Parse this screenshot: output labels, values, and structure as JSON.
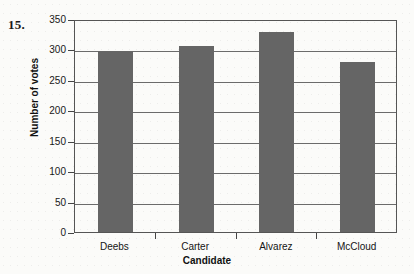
{
  "exercise": {
    "number": "15."
  },
  "chart_data": {
    "type": "bar",
    "title": "",
    "xlabel": "Candidate",
    "ylabel": "Number of votes",
    "categories": [
      "Deebs",
      "Carter",
      "Alvarez",
      "McCloud"
    ],
    "values": [
      297,
      305,
      329,
      280
    ],
    "ylim": [
      0,
      350
    ],
    "yticks": [
      0,
      50,
      100,
      150,
      200,
      250,
      300,
      350
    ],
    "ytick_labels": [
      "0",
      "50",
      "100",
      "150",
      "200",
      "250",
      "300",
      "350"
    ],
    "grid": true,
    "legend": false,
    "bar_color": "#656565",
    "axis_color": "#555555",
    "background_color": "#fbfbf9"
  }
}
